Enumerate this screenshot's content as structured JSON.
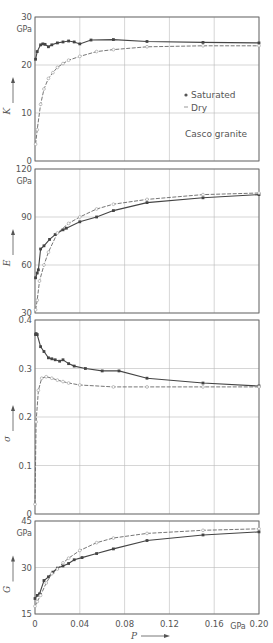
{
  "figure": {
    "x_axis": {
      "label": "P",
      "unit": "GPa",
      "ticks": [
        "0",
        "0.04",
        "0.08",
        "0.12",
        "0.16",
        "0.20"
      ],
      "range": [
        0,
        0.2
      ]
    },
    "legend": {
      "saturated": "Saturated",
      "dry": "Dry",
      "note": "Casco granite"
    }
  },
  "chart_data": [
    {
      "type": "line",
      "title": "",
      "xlabel": "P (GPa)",
      "ylabel": "K",
      "unit": "GPa",
      "ylim": [
        0,
        30
      ],
      "yticks": [
        "0",
        "10",
        "20",
        "30"
      ],
      "grid": true,
      "legend": [
        "Saturated",
        "Dry"
      ],
      "annotation": "Casco granite",
      "series": [
        {
          "name": "Saturated",
          "marker": "filled",
          "x": [
            0.0005,
            0.002,
            0.005,
            0.007,
            0.009,
            0.012,
            0.015,
            0.02,
            0.025,
            0.03,
            0.035,
            0.04,
            0.05,
            0.07,
            0.1,
            0.15,
            0.2
          ],
          "y": [
            21.2,
            22.8,
            24.2,
            24.4,
            24.3,
            23.8,
            24.2,
            24.6,
            24.8,
            25.0,
            24.8,
            24.4,
            25.2,
            25.3,
            24.9,
            24.7,
            24.6
          ]
        },
        {
          "name": "Dry",
          "marker": "open",
          "x": [
            0.0005,
            0.002,
            0.005,
            0.008,
            0.012,
            0.016,
            0.02,
            0.025,
            0.03,
            0.04,
            0.055,
            0.07,
            0.1,
            0.15,
            0.2
          ],
          "y": [
            3.5,
            6.5,
            11.8,
            15.0,
            17.2,
            18.4,
            19.5,
            20.3,
            21.0,
            21.8,
            22.8,
            23.2,
            23.8,
            24.0,
            24.0
          ]
        }
      ]
    },
    {
      "type": "line",
      "xlabel": "P (GPa)",
      "ylabel": "E",
      "unit": "GPa",
      "ylim": [
        30,
        120
      ],
      "yticks": [
        "30",
        "60",
        "90",
        "120"
      ],
      "grid": true,
      "series": [
        {
          "name": "Saturated",
          "marker": "filled",
          "x": [
            0.0005,
            0.002,
            0.003,
            0.005,
            0.008,
            0.013,
            0.018,
            0.025,
            0.028,
            0.04,
            0.055,
            0.07,
            0.1,
            0.15,
            0.2
          ],
          "y": [
            52,
            55,
            57,
            70,
            72,
            76,
            79,
            82,
            83,
            87,
            90,
            94,
            99,
            102,
            104
          ]
        },
        {
          "name": "Dry",
          "marker": "open",
          "x": [
            0.0005,
            0.002,
            0.004,
            0.008,
            0.012,
            0.02,
            0.03,
            0.04,
            0.055,
            0.07,
            0.1,
            0.15,
            0.2
          ],
          "y": [
            32,
            38,
            50,
            60,
            68,
            80,
            86,
            90,
            95,
            98,
            101,
            104,
            105
          ]
        }
      ]
    },
    {
      "type": "line",
      "xlabel": "P (GPa)",
      "ylabel": "σ",
      "unit": "",
      "ylim": [
        0,
        0.4
      ],
      "yticks": [
        "0",
        "0.1",
        "0.2",
        "0.3",
        "0.4"
      ],
      "grid": true,
      "series": [
        {
          "name": "Saturated",
          "marker": "filled",
          "x": [
            0.0005,
            0.001,
            0.002,
            0.005,
            0.008,
            0.012,
            0.015,
            0.018,
            0.022,
            0.025,
            0.03,
            0.035,
            0.045,
            0.06,
            0.075,
            0.1,
            0.15,
            0.2
          ],
          "y": [
            0.37,
            0.372,
            0.37,
            0.345,
            0.335,
            0.322,
            0.32,
            0.318,
            0.315,
            0.318,
            0.31,
            0.305,
            0.3,
            0.295,
            0.295,
            0.28,
            0.27,
            0.264
          ]
        },
        {
          "name": "Dry",
          "marker": "open",
          "x": [
            0.0,
            0.001,
            0.003,
            0.006,
            0.01,
            0.015,
            0.02,
            0.025,
            0.03,
            0.04,
            0.07,
            0.1,
            0.15,
            0.2
          ],
          "y": [
            0.02,
            0.19,
            0.255,
            0.28,
            0.283,
            0.28,
            0.276,
            0.273,
            0.27,
            0.266,
            0.262,
            0.262,
            0.262,
            0.262
          ]
        }
      ]
    },
    {
      "type": "line",
      "xlabel": "P (GPa)",
      "ylabel": "G",
      "unit": "GPa",
      "ylim": [
        15,
        45
      ],
      "yticks": [
        "15",
        "30",
        "45"
      ],
      "grid": true,
      "series": [
        {
          "name": "Saturated",
          "marker": "filled",
          "x": [
            0.0,
            0.002,
            0.004,
            0.008,
            0.012,
            0.016,
            0.02,
            0.025,
            0.03,
            0.035,
            0.042,
            0.055,
            0.07,
            0.1,
            0.15,
            0.2
          ],
          "y": [
            20,
            21,
            21.5,
            25.8,
            27,
            28.5,
            29.8,
            30.5,
            31.3,
            32.5,
            33.2,
            34.5,
            36,
            38.7,
            40.5,
            41.5
          ]
        },
        {
          "name": "Dry",
          "marker": "open",
          "x": [
            0.0,
            0.002,
            0.005,
            0.01,
            0.015,
            0.02,
            0.025,
            0.03,
            0.04,
            0.055,
            0.07,
            0.1,
            0.15,
            0.2
          ],
          "y": [
            17.5,
            19,
            21,
            25,
            28,
            29.5,
            31.5,
            33,
            35.5,
            38,
            39.5,
            41,
            42,
            42.5
          ]
        }
      ]
    }
  ]
}
